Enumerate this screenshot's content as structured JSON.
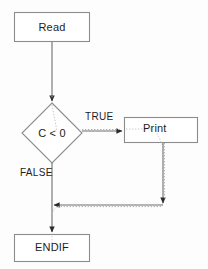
{
  "diagram": {
    "type": "flowchart",
    "background_color": "#fdfdfd",
    "stroke_color": "#808080",
    "dotted_color": "#9a9a9a",
    "text_color": "#1d1d1d",
    "nodes": [
      {
        "id": "read",
        "shape": "process",
        "label": "Read",
        "x": 14,
        "y": 12,
        "width": 76,
        "height": 30
      },
      {
        "id": "condition",
        "shape": "decision",
        "label": "C < 0",
        "cx": 52,
        "cy": 133,
        "rx": 30,
        "ry": 30
      },
      {
        "id": "print",
        "shape": "process",
        "label": "Print",
        "x": 124,
        "y": 117,
        "width": 74,
        "height": 26
      },
      {
        "id": "endif",
        "shape": "process",
        "label": "ENDIF",
        "x": 14,
        "y": 234,
        "width": 76,
        "height": 28
      }
    ],
    "edges": [
      {
        "id": "read-to-condition",
        "from": "read",
        "to": "condition",
        "label": "",
        "style": "solid-with-dotted-overlay",
        "arrow": "down"
      },
      {
        "id": "condition-to-print",
        "from": "condition",
        "to": "print",
        "label": "TRUE",
        "label_x": 85,
        "label_y": 112,
        "style": "solid-with-dotted-overlay",
        "arrow": "right"
      },
      {
        "id": "condition-to-endif",
        "from": "condition",
        "to": "endif",
        "label": "FALSE",
        "label_x": 20,
        "label_y": 167,
        "style": "solid",
        "arrow": "down"
      },
      {
        "id": "print-to-endif",
        "from": "print",
        "to": "endif",
        "label": "",
        "style": "solid-with-dotted-overlay",
        "arrow": "down-then-left"
      }
    ]
  }
}
